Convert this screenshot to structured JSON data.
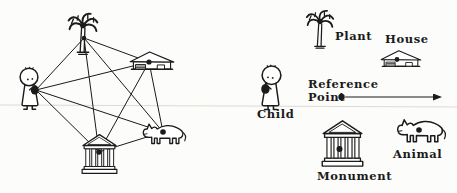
{
  "colors": {
    "ink": "#1b1b1b",
    "background": "#fcfcfa"
  },
  "legend": {
    "plant": {
      "label": "Plant"
    },
    "house": {
      "label": "House"
    },
    "child": {
      "label": "Child"
    },
    "reference_point": {
      "label": "Reference\nPoint"
    },
    "monument": {
      "label": "Monument"
    },
    "animal": {
      "label": "Animal"
    }
  },
  "graph": {
    "description": "Complete graph: every scene object is linked to every other",
    "nodes": [
      {
        "id": "child",
        "x": 36,
        "y": 90,
        "dot": false,
        "r": 0
      },
      {
        "id": "plant",
        "x": 84,
        "y": 38,
        "dot": true,
        "r": 2.2
      },
      {
        "id": "house",
        "x": 149,
        "y": 62,
        "dot": true,
        "r": 2.6
      },
      {
        "id": "monument",
        "x": 99,
        "y": 152,
        "dot": true,
        "r": 2.8
      },
      {
        "id": "animal",
        "x": 163,
        "y": 132,
        "dot": true,
        "r": 2.8
      }
    ],
    "edges": [
      [
        "child",
        "plant"
      ],
      [
        "child",
        "house"
      ],
      [
        "child",
        "monument"
      ],
      [
        "child",
        "animal"
      ],
      [
        "plant",
        "house"
      ],
      [
        "plant",
        "monument"
      ],
      [
        "plant",
        "animal"
      ],
      [
        "house",
        "monument"
      ],
      [
        "house",
        "animal"
      ],
      [
        "monument",
        "animal"
      ]
    ]
  }
}
